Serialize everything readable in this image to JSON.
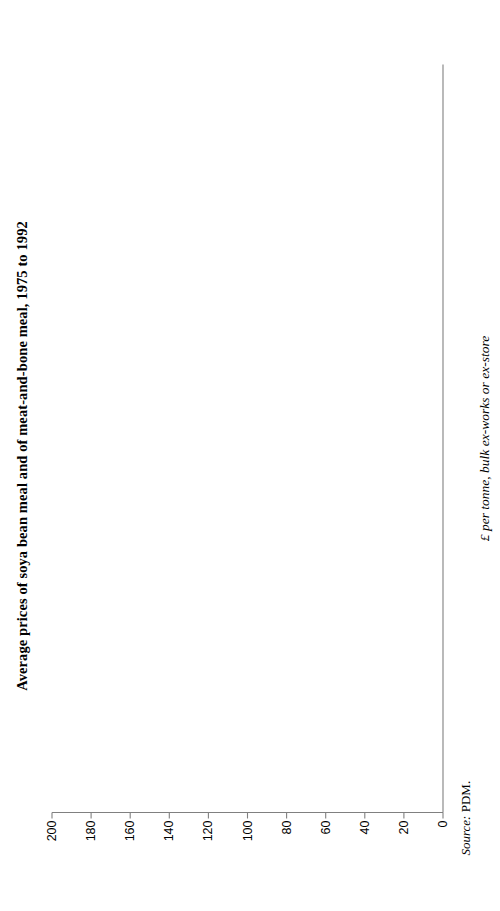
{
  "figure": {
    "title": "Average prices of soya bean meal and of meat-and-bone meal, 1975 to 1992",
    "source_label": "Source:",
    "source_value": "PDM."
  },
  "legend": {
    "position": "bottom-left-inside",
    "items": [
      {
        "label": "M&B meal",
        "style": "solid"
      },
      {
        "label": "SB meal",
        "style": "dashed"
      }
    ]
  },
  "axes": {
    "x": {
      "label": "",
      "ticks": [
        "75",
        "76",
        "77",
        "78",
        "79",
        "80",
        "81",
        "82",
        "83",
        "84",
        "85",
        "86",
        "87",
        "88",
        "89",
        "90",
        "91",
        "92"
      ],
      "range": [
        75,
        92
      ]
    },
    "y": {
      "label": "£ per tonne, bulk ex-works or ex-store",
      "ticks": [
        "0",
        "20",
        "40",
        "60",
        "80",
        "100",
        "120",
        "140",
        "160",
        "180",
        "200"
      ],
      "range": [
        0,
        200
      ],
      "zero_tick": "0"
    }
  },
  "colors": {
    "line": "#000000",
    "axis": "#808080",
    "legend_border": "#8a8a8a",
    "background": "#ffffff"
  },
  "chart_data": {
    "type": "line",
    "title": "Average prices of soya bean meal and of meat-and-bone meal, 1975 to 1992",
    "xlabel": "",
    "ylabel": "£ per tonne, bulk ex-works or ex-store",
    "xlim": [
      75,
      92
    ],
    "ylim": [
      0,
      200
    ],
    "grid": false,
    "legend_position": "bottom-left-inside",
    "x": [
      1975,
      1976,
      1977,
      1978,
      1979,
      1980,
      1981,
      1982,
      1983,
      1984,
      1985,
      1986,
      1987,
      1988,
      1989,
      1990,
      1991,
      1992
    ],
    "categories": [
      "75",
      "76",
      "77",
      "78",
      "79",
      "80",
      "81",
      "82",
      "83",
      "84",
      "85",
      "86",
      "87",
      "88",
      "89",
      "90",
      "91",
      "92"
    ],
    "series": [
      {
        "name": "M&B meal",
        "style": "solid",
        "x": [
          1975,
          1976,
          1977,
          1978,
          1979,
          1980,
          1981,
          1982,
          1983,
          1984,
          1985,
          1986,
          1987,
          1988,
          1989,
          1990,
          1991,
          1992
        ],
        "values": [
          80,
          119,
          139,
          142,
          135,
          133,
          149,
          153,
          152,
          173,
          154,
          151,
          141,
          157,
          140,
          138,
          122,
          146
        ]
      },
      {
        "name": "SB meal",
        "style": "dashed",
        "x": [
          1980,
          1981,
          1982,
          1983,
          1984,
          1985,
          1986,
          1987,
          1988,
          1989,
          1990,
          1991,
          1992
        ],
        "values": [
          147,
          160,
          162,
          163,
          178,
          159,
          163,
          166,
          164,
          182,
          180,
          178,
          164
        ]
      }
    ]
  }
}
